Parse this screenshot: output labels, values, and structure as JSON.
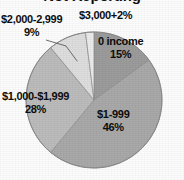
{
  "figure": {
    "title": "Not Reporting",
    "title_clipped": true,
    "background_color": "#fdfdfd"
  },
  "chart_data": {
    "type": "pie",
    "title": "Not Reporting",
    "xlabel": "",
    "ylabel": "",
    "categories": [
      "0 income",
      "$1-999",
      "$1,000-$1,999",
      "$2,000-2,999",
      "$3,000+"
    ],
    "values": [
      15,
      46,
      28,
      9,
      2
    ],
    "value_unit": "%",
    "start_angle_deg": 0,
    "direction": "clockwise",
    "legend": "none",
    "grid": false,
    "labels_inside": true,
    "slices": [
      {
        "name": "0 income",
        "label": "0 income",
        "percent_label": "15%",
        "value": 15,
        "color": "#9c9c9c",
        "leader_line": false
      },
      {
        "name": "$1-999",
        "label": "$1-999",
        "percent_label": "46%",
        "value": 46,
        "color": "#a9a9a9",
        "leader_line": false
      },
      {
        "name": "$1,000-$1,999",
        "label": "$1,000-$1,999",
        "percent_label": "28%",
        "value": 28,
        "color": "#bcbcbc",
        "leader_line": false
      },
      {
        "name": "$2,000-2,999",
        "label": "$2,000-2,999",
        "percent_label": "9%",
        "value": 9,
        "color": "#dedede",
        "leader_line": true
      },
      {
        "name": "$3,000+",
        "label": "$3,000+",
        "percent_label": "2%",
        "value": 2,
        "color": "#ebebeb",
        "leader_line": false
      }
    ]
  }
}
